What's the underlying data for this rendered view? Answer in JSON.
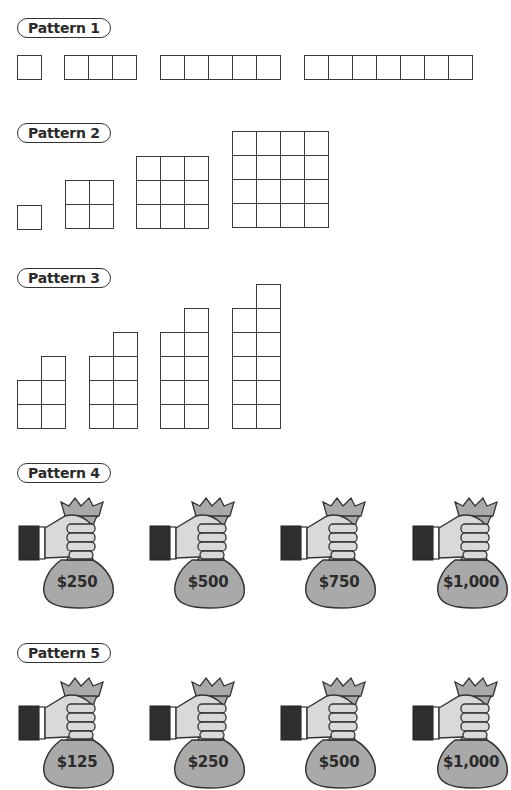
{
  "patterns": [
    {
      "label": "Pattern 1",
      "type": "row-of-squares",
      "terms": [
        1,
        3,
        5,
        7
      ]
    },
    {
      "label": "Pattern 2",
      "type": "square-grids",
      "terms": [
        1,
        4,
        9,
        16
      ],
      "sides": [
        1,
        2,
        3,
        4
      ]
    },
    {
      "label": "Pattern 3",
      "type": "two-column-staircase",
      "terms": [
        5,
        7,
        9,
        11
      ],
      "left_heights": [
        2,
        3,
        4,
        5
      ],
      "right_heights": [
        3,
        4,
        5,
        6
      ]
    },
    {
      "label": "Pattern 4",
      "type": "money-bags",
      "amounts": [
        "$250",
        "$500",
        "$750",
        "$1,000"
      ]
    },
    {
      "label": "Pattern 5",
      "type": "money-bags",
      "amounts": [
        "$125",
        "$250",
        "$500",
        "$1,000"
      ]
    }
  ],
  "colors": {
    "line": "#3a3a3a",
    "bag": "#a9a9a9",
    "hand": "#d9d9d9",
    "sleeve": "#2f2f2f"
  }
}
